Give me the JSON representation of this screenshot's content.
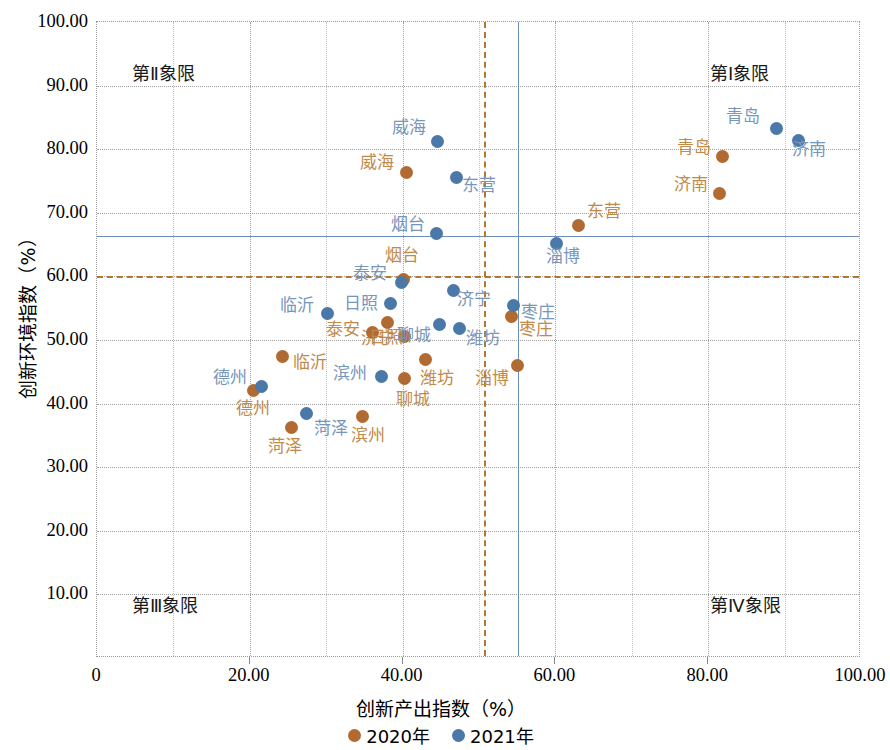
{
  "chart_data": {
    "type": "scatter",
    "title": "",
    "xlabel": "创新产出指数（%）",
    "ylabel": "创新环境指数（%）",
    "xlim": [
      0,
      100
    ],
    "ylim": [
      0,
      100
    ],
    "grid": true,
    "x_ticks": [
      "0",
      "20.00",
      "40.00",
      "60.00",
      "80.00",
      "100.00"
    ],
    "x_tick_values": [
      0,
      20,
      40,
      60,
      80,
      100
    ],
    "y_ticks": [
      "10.00",
      "20.00",
      "30.00",
      "40.00",
      "50.00",
      "60.00",
      "70.00",
      "80.00",
      "90.00",
      "100.00"
    ],
    "y_tick_values": [
      10,
      20,
      30,
      40,
      50,
      60,
      70,
      80,
      90,
      100
    ],
    "legend_position": "bottom",
    "legend": [
      "2020年",
      "2021年"
    ],
    "series": [
      {
        "name": "2020年",
        "color": "#b06a32",
        "label_color": "#c08a4a",
        "points": [
          {
            "label": "青岛",
            "x": 81.9,
            "y": 78.8,
            "lx": -46,
            "ly": -9
          },
          {
            "label": "济南",
            "x": 81.5,
            "y": 73.0,
            "lx": -46,
            "ly": -9
          },
          {
            "label": "威海",
            "x": 40.5,
            "y": 76.4,
            "lx": -46,
            "ly": -9
          },
          {
            "label": "东营",
            "x": 63.0,
            "y": 68.0,
            "lx": 9,
            "ly": -14
          },
          {
            "label": "烟台",
            "x": 40.1,
            "y": 59.5,
            "lx": -18,
            "ly": -24
          },
          {
            "label": "济宁",
            "x": 40.3,
            "y": 50.5,
            "lx": -44,
            "ly": 2
          },
          {
            "label": "泰安",
            "x": 36.0,
            "y": 51.2,
            "lx": -46,
            "ly": -2
          },
          {
            "label": "日照",
            "x": 38.0,
            "y": 52.8,
            "lx": -18,
            "ly": 16
          },
          {
            "label": "临沂",
            "x": 24.3,
            "y": 47.4,
            "lx": 10,
            "ly": 6
          },
          {
            "label": "潍坊",
            "x": 43.0,
            "y": 47.0,
            "lx": -6,
            "ly": 20
          },
          {
            "label": "聊城",
            "x": 40.2,
            "y": 44.0,
            "lx": -8,
            "ly": 22
          },
          {
            "label": "枣庄",
            "x": 54.2,
            "y": 53.7,
            "lx": 8,
            "ly": 14
          },
          {
            "label": "淄博",
            "x": 55.0,
            "y": 46.0,
            "lx": -42,
            "ly": 14
          },
          {
            "label": "德州",
            "x": 20.5,
            "y": 42.0,
            "lx": -18,
            "ly": 18
          },
          {
            "label": "滨州",
            "x": 34.8,
            "y": 38.0,
            "lx": -12,
            "ly": 20
          },
          {
            "label": "菏泽",
            "x": 25.5,
            "y": 36.3,
            "lx": -24,
            "ly": 20
          }
        ]
      },
      {
        "name": "2021年",
        "color": "#4a78a8",
        "label_color": "#7796bb",
        "points": [
          {
            "label": "青岛",
            "x": 88.9,
            "y": 83.2,
            "lx": -50,
            "ly": -12
          },
          {
            "label": "济南",
            "x": 91.8,
            "y": 81.4,
            "lx": -6,
            "ly": 10
          },
          {
            "label": "威海",
            "x": 44.6,
            "y": 81.2,
            "lx": -46,
            "ly": -14
          },
          {
            "label": "东营",
            "x": 47.0,
            "y": 75.5,
            "lx": 6,
            "ly": 8
          },
          {
            "label": "烟台",
            "x": 44.5,
            "y": 66.8,
            "lx": -46,
            "ly": -8
          },
          {
            "label": "淄博",
            "x": 60.1,
            "y": 65.2,
            "lx": -10,
            "ly": 14
          },
          {
            "label": "枣庄",
            "x": 54.5,
            "y": 55.5,
            "lx": 8,
            "ly": 8
          },
          {
            "label": "济宁",
            "x": 46.6,
            "y": 57.8,
            "lx": 4,
            "ly": 10
          },
          {
            "label": "泰安",
            "x": 39.8,
            "y": 59.0,
            "lx": -48,
            "ly": -9
          },
          {
            "label": "日照",
            "x": 38.4,
            "y": 55.7,
            "lx": -46,
            "ly": 0
          },
          {
            "label": "临沂",
            "x": 30.2,
            "y": 54.2,
            "lx": -48,
            "ly": -7
          },
          {
            "label": "潍坊",
            "x": 47.5,
            "y": 51.8,
            "lx": 6,
            "ly": 10
          },
          {
            "label": "聊城",
            "x": 44.8,
            "y": 52.5,
            "lx": -42,
            "ly": 12
          },
          {
            "label": "滨州",
            "x": 37.2,
            "y": 44.3,
            "lx": -48,
            "ly": -2
          },
          {
            "label": "德州",
            "x": 21.5,
            "y": 42.7,
            "lx": -48,
            "ly": -8
          },
          {
            "label": "菏泽",
            "x": 27.4,
            "y": 38.5,
            "lx": 8,
            "ly": 16
          }
        ]
      }
    ],
    "reference_lines": {
      "h_blue_value": 66.3,
      "h_brown_value": 60.1,
      "v_blue_value": 55.1,
      "v_brown_value": 50.7
    },
    "quadrant_labels": [
      {
        "text": "第Ⅰ象限",
        "corner": "top-right"
      },
      {
        "text": "第Ⅱ象限",
        "corner": "top-left"
      },
      {
        "text": "第Ⅲ象限",
        "corner": "bottom-left"
      },
      {
        "text": "第Ⅳ象限",
        "corner": "bottom-right"
      }
    ]
  }
}
